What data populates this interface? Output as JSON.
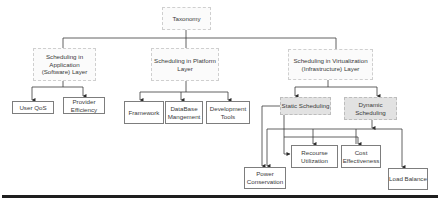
{
  "diagram": {
    "root": {
      "label": "Taxonomy"
    },
    "layers": [
      {
        "label": "Scheduling in Application (Software) Layer",
        "children": [
          "User QoS",
          "Provider Efficiency"
        ]
      },
      {
        "label": "Scheduling in Platform Layer",
        "children": [
          "Framework",
          "DataBase Mangement",
          "Development Tools"
        ]
      },
      {
        "label": "Scheduling in Virtualization (Infrastructure) Layer",
        "children": [
          "Static Scheduling",
          "Dynamic Scheduling"
        ]
      }
    ],
    "scheduling_types": [
      {
        "label": "Static Scheduling"
      },
      {
        "label": "Dynamic Scheduling"
      }
    ],
    "objectives": [
      {
        "label": "Recourse Utilization"
      },
      {
        "label": "Cost Effectiveness"
      },
      {
        "label": "Power Conservation"
      },
      {
        "label": "Load Balance"
      }
    ],
    "leaves": {
      "user_qos": "User QoS",
      "provider_efficiency": "Provider Efficiency",
      "framework": "Framework",
      "database_mgmt": "DataBase Mangement",
      "dev_tools": "Development Tools"
    },
    "colors": {
      "highlight_fill": "#e2e2e2",
      "line": "#3a3a3a",
      "rule": "#1e1e1e"
    }
  }
}
